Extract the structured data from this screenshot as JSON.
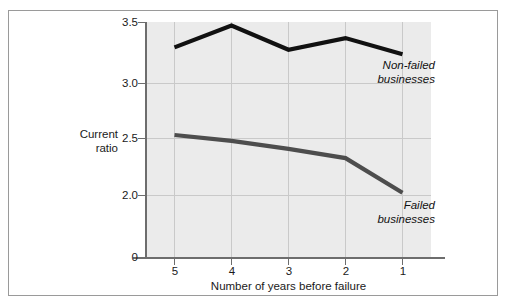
{
  "chart_data": {
    "type": "line",
    "title": "",
    "xlabel": "Number of years before failure",
    "ylabel": "Current ratio",
    "ylabel_line1": "Current",
    "ylabel_line2": "ratio",
    "categories": [
      "5",
      "4",
      "3",
      "2",
      "1"
    ],
    "x": [
      5,
      4,
      3,
      2,
      1
    ],
    "xlim": [
      5,
      1
    ],
    "ylim": [
      0,
      3.5
    ],
    "y_ticks": [
      "0",
      "2.0",
      "2.5",
      "3.0",
      "3.5"
    ],
    "y_tick_values": [
      0,
      2.0,
      2.5,
      3.0,
      3.5
    ],
    "grid": true,
    "grid_color": "#c9c9c9",
    "plot_background": "#ebebeb",
    "legend_position": "inline-annotation",
    "axis_break": true,
    "series": [
      {
        "name": "Non-failed businesses",
        "annotation_line1": "Non-failed",
        "annotation_line2": "businesses",
        "color": "#111111",
        "line_width": 4.2,
        "values": [
          3.28,
          3.47,
          3.26,
          3.36,
          3.22
        ]
      },
      {
        "name": "Failed businesses",
        "annotation_line1": "Failed",
        "annotation_line2": "businesses",
        "color": "#4d4d4d",
        "line_width": 4.2,
        "values": [
          2.52,
          2.47,
          2.4,
          2.32,
          2.02
        ]
      }
    ]
  },
  "figure": {
    "border_color": "#9a9a9a",
    "background": "#ffffff",
    "caption_fragment": ""
  }
}
